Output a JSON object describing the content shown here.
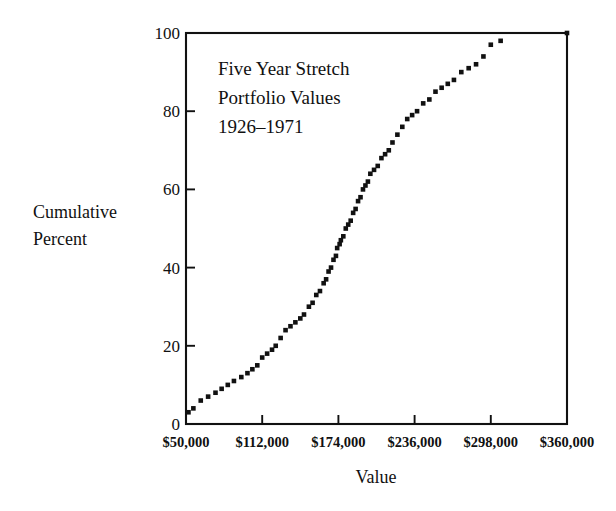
{
  "chart_data": {
    "type": "scatter",
    "title_lines": [
      "Five Year Stretch",
      "Portfolio Values",
      "1926–1971"
    ],
    "xlabel": "Value",
    "ylabel": "Cumulative Percent",
    "ylabel_lines": [
      "Cumulative",
      "Percent"
    ],
    "grid": false,
    "legend": "none",
    "xlim": [
      50000,
      360000
    ],
    "ylim": [
      0,
      100
    ],
    "xticks": [
      50000,
      112000,
      174000,
      236000,
      298000,
      360000
    ],
    "xtick_labels": [
      "$50,000",
      "$112,000",
      "$174,000",
      "$236,000",
      "$298,000",
      "$360,000"
    ],
    "yticks": [
      0,
      20,
      40,
      60,
      80,
      100
    ],
    "ytick_labels": [
      "0",
      "20",
      "40",
      "60",
      "80",
      "100"
    ],
    "marker": "square",
    "marker_color": "#111111",
    "x": [
      52000,
      56000,
      62000,
      68000,
      74000,
      79000,
      84000,
      89000,
      95000,
      100000,
      104000,
      108000,
      112000,
      116000,
      120000,
      123000,
      127000,
      131000,
      135000,
      139000,
      143000,
      146000,
      150000,
      153000,
      156000,
      159000,
      162000,
      164000,
      166000,
      168000,
      170000,
      172000,
      173000,
      175000,
      176000,
      178000,
      180000,
      182000,
      184000,
      186000,
      188000,
      190000,
      192000,
      194000,
      196000,
      198000,
      200000,
      203000,
      206000,
      209000,
      212000,
      215000,
      218000,
      222000,
      226000,
      230000,
      234000,
      238000,
      243000,
      248000,
      253000,
      258000,
      263000,
      268000,
      274000,
      280000,
      286000,
      292000,
      298000,
      306000,
      360000
    ],
    "y": [
      3,
      4,
      6,
      7,
      8,
      9,
      10,
      11,
      12,
      13,
      14,
      15,
      17,
      18,
      19,
      20,
      22,
      24,
      25,
      26,
      27,
      28,
      30,
      31,
      33,
      34,
      36,
      37,
      39,
      40,
      42,
      43,
      45,
      46,
      47,
      48,
      50,
      51,
      52,
      54,
      55,
      57,
      58,
      60,
      61,
      62,
      64,
      65,
      66,
      68,
      69,
      70,
      72,
      74,
      76,
      78,
      79,
      80,
      82,
      83,
      85,
      86,
      87,
      88,
      90,
      91,
      92,
      94,
      97,
      98,
      100
    ]
  }
}
